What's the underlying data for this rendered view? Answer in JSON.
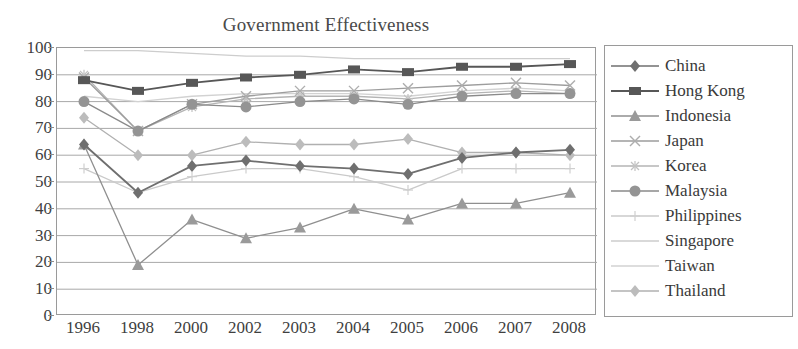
{
  "chart_data": {
    "type": "line",
    "title": "Government Effectiveness",
    "xlabel": "",
    "ylabel": "",
    "ylim": [
      0,
      100
    ],
    "ytick_step": 10,
    "yticks": [
      100,
      90,
      80,
      70,
      60,
      50,
      40,
      30,
      20,
      10,
      0
    ],
    "grid": true,
    "grid_axis": "y",
    "legend_position": "right",
    "categories": [
      "1996",
      "1998",
      "2000",
      "2002",
      "2003",
      "2004",
      "2005",
      "2006",
      "2007",
      "2008"
    ],
    "series": [
      {
        "name": "China",
        "marker": "diamond",
        "color": "#6f6f6f",
        "line_color": "#6f6f6f",
        "values": [
          64,
          46,
          56,
          58,
          56,
          55,
          53,
          59,
          61,
          62
        ]
      },
      {
        "name": "Hong Kong",
        "marker": "square",
        "color": "#575757",
        "line_color": "#575757",
        "values": [
          88,
          84,
          87,
          89,
          90,
          92,
          91,
          93,
          93,
          94
        ]
      },
      {
        "name": "Indonesia",
        "marker": "triangle",
        "color": "#9a9a9a",
        "line_color": "#8f8f8f",
        "values": [
          64,
          19,
          36,
          29,
          33,
          40,
          36,
          42,
          42,
          46
        ]
      },
      {
        "name": "Japan",
        "marker": "x",
        "color": "#adadad",
        "line_color": "#9d9d9d",
        "values": [
          89,
          69,
          79,
          82,
          84,
          84,
          85,
          86,
          87,
          86
        ]
      },
      {
        "name": "Korea",
        "marker": "star",
        "color": "#c2c2c2",
        "line_color": "#b4b4b4",
        "values": [
          90,
          69,
          78,
          81,
          82,
          82,
          81,
          83,
          84,
          83
        ]
      },
      {
        "name": "Malaysia",
        "marker": "circle",
        "color": "#949494",
        "line_color": "#8a8a8a",
        "values": [
          80,
          69,
          79,
          78,
          80,
          81,
          79,
          82,
          83,
          83
        ]
      },
      {
        "name": "Philippines",
        "marker": "plus",
        "color": "#cfcfcf",
        "line_color": "#cacaca",
        "values": [
          55,
          46,
          52,
          55,
          55,
          52,
          47,
          55,
          55,
          55
        ]
      },
      {
        "name": "Singapore",
        "marker": "none",
        "color": "#d6d6d6",
        "line_color": "#cdcdcd",
        "values": [
          99,
          99,
          98,
          97,
          97,
          96,
          96,
          96,
          96,
          96
        ]
      },
      {
        "name": "Taiwan",
        "marker": "none",
        "color": "#dadada",
        "line_color": "#d2d2d2",
        "values": [
          82,
          80,
          82,
          83,
          83,
          83,
          82,
          84,
          85,
          84
        ]
      },
      {
        "name": "Thailand",
        "marker": "diamond",
        "color": "#bcbcbc",
        "line_color": "#b0b0b0",
        "values": [
          74,
          60,
          60,
          65,
          64,
          64,
          66,
          61,
          61,
          60
        ]
      }
    ]
  },
  "legend": {
    "items": [
      {
        "label": "China"
      },
      {
        "label": "Hong Kong"
      },
      {
        "label": "Indonesia"
      },
      {
        "label": "Japan"
      },
      {
        "label": "Korea"
      },
      {
        "label": "Malaysia"
      },
      {
        "label": "Philippines"
      },
      {
        "label": "Singapore"
      },
      {
        "label": "Taiwan"
      },
      {
        "label": "Thailand"
      }
    ]
  },
  "colors": {
    "axis": "#9a9a9a",
    "grid": "#a8a8a8",
    "text": "#3a3a3a",
    "background": "#ffffff"
  }
}
